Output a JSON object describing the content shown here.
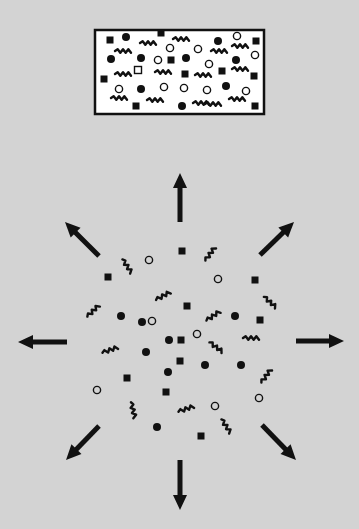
{
  "figure": {
    "title": "Diffusion of confined particles",
    "background_color": "#d3d3d3",
    "ink_color": "#111111",
    "box_fill": "#ffffff"
  },
  "container": {
    "x": 95,
    "y": 30,
    "w": 169,
    "h": 84,
    "particles": [
      {
        "type": "square",
        "x": 110,
        "y": 40
      },
      {
        "type": "dot",
        "x": 126,
        "y": 37
      },
      {
        "type": "square",
        "x": 161,
        "y": 33
      },
      {
        "type": "squiggle",
        "x": 148,
        "y": 43,
        "angle": 0
      },
      {
        "type": "squiggle",
        "x": 181,
        "y": 39,
        "angle": 0
      },
      {
        "type": "circle",
        "x": 170,
        "y": 48
      },
      {
        "type": "dot",
        "x": 218,
        "y": 41
      },
      {
        "type": "circle",
        "x": 237,
        "y": 36
      },
      {
        "type": "squiggle",
        "x": 240,
        "y": 46,
        "angle": 0
      },
      {
        "type": "square",
        "x": 256,
        "y": 41
      },
      {
        "type": "squiggle",
        "x": 123,
        "y": 51,
        "angle": 0
      },
      {
        "type": "circle",
        "x": 198,
        "y": 49
      },
      {
        "type": "squiggle",
        "x": 219,
        "y": 51,
        "angle": 0
      },
      {
        "type": "circle",
        "x": 255,
        "y": 55
      },
      {
        "type": "dot",
        "x": 111,
        "y": 59
      },
      {
        "type": "dot",
        "x": 141,
        "y": 58
      },
      {
        "type": "circle",
        "x": 158,
        "y": 60
      },
      {
        "type": "square",
        "x": 171,
        "y": 60
      },
      {
        "type": "dot",
        "x": 186,
        "y": 58
      },
      {
        "type": "circle",
        "x": 209,
        "y": 64
      },
      {
        "type": "dot",
        "x": 236,
        "y": 60
      },
      {
        "type": "squiggle",
        "x": 123,
        "y": 74,
        "angle": 0
      },
      {
        "type": "opensquare",
        "x": 138,
        "y": 70
      },
      {
        "type": "squiggle",
        "x": 163,
        "y": 72,
        "angle": 0
      },
      {
        "type": "square",
        "x": 185,
        "y": 74
      },
      {
        "type": "squiggle",
        "x": 203,
        "y": 75,
        "angle": 0
      },
      {
        "type": "square",
        "x": 222,
        "y": 71
      },
      {
        "type": "squiggle",
        "x": 240,
        "y": 69,
        "angle": 0
      },
      {
        "type": "square",
        "x": 104,
        "y": 79
      },
      {
        "type": "square",
        "x": 254,
        "y": 76
      },
      {
        "type": "circle",
        "x": 119,
        "y": 89
      },
      {
        "type": "dot",
        "x": 141,
        "y": 89
      },
      {
        "type": "circle",
        "x": 164,
        "y": 87
      },
      {
        "type": "circle",
        "x": 184,
        "y": 88
      },
      {
        "type": "circle",
        "x": 207,
        "y": 90
      },
      {
        "type": "dot",
        "x": 226,
        "y": 86
      },
      {
        "type": "circle",
        "x": 246,
        "y": 91
      },
      {
        "type": "squiggle",
        "x": 119,
        "y": 98,
        "angle": 0
      },
      {
        "type": "squiggle",
        "x": 155,
        "y": 100,
        "angle": 0
      },
      {
        "type": "squiggle",
        "x": 201,
        "y": 103,
        "angle": 0
      },
      {
        "type": "squiggle",
        "x": 237,
        "y": 99,
        "angle": 0
      },
      {
        "type": "square",
        "x": 136,
        "y": 106
      },
      {
        "type": "dot",
        "x": 182,
        "y": 106
      },
      {
        "type": "squiggle",
        "x": 213,
        "y": 104,
        "angle": 0
      },
      {
        "type": "square",
        "x": 255,
        "y": 106
      }
    ]
  },
  "arrows": [
    {
      "direction": "up",
      "x1": 180,
      "y1": 222,
      "x2": 180,
      "y2": 173
    },
    {
      "direction": "up-right",
      "x1": 260,
      "y1": 255,
      "x2": 294,
      "y2": 222
    },
    {
      "direction": "right",
      "x1": 296,
      "y1": 341,
      "x2": 344,
      "y2": 341
    },
    {
      "direction": "down-right",
      "x1": 262,
      "y1": 425,
      "x2": 296,
      "y2": 460
    },
    {
      "direction": "down",
      "x1": 180,
      "y1": 460,
      "x2": 180,
      "y2": 510
    },
    {
      "direction": "down-left",
      "x1": 99,
      "y1": 426,
      "x2": 66,
      "y2": 460
    },
    {
      "direction": "left",
      "x1": 67,
      "y1": 342,
      "x2": 18,
      "y2": 342
    },
    {
      "direction": "up-left",
      "x1": 99,
      "y1": 256,
      "x2": 65,
      "y2": 222
    }
  ],
  "dispersed": {
    "particles": [
      {
        "type": "square",
        "x": 182,
        "y": 251
      },
      {
        "type": "squiggle",
        "x": 127,
        "y": 266,
        "angle": 55
      },
      {
        "type": "circle",
        "x": 149,
        "y": 260
      },
      {
        "type": "squiggle",
        "x": 210,
        "y": 254,
        "angle": -55
      },
      {
        "type": "square",
        "x": 108,
        "y": 277
      },
      {
        "type": "circle",
        "x": 218,
        "y": 279
      },
      {
        "type": "square",
        "x": 255,
        "y": 280
      },
      {
        "type": "squiggle",
        "x": 163,
        "y": 296,
        "angle": -30
      },
      {
        "type": "squiggle",
        "x": 93,
        "y": 311,
        "angle": -45
      },
      {
        "type": "square",
        "x": 187,
        "y": 306
      },
      {
        "type": "squiggle",
        "x": 270,
        "y": 302,
        "angle": 40
      },
      {
        "type": "dot",
        "x": 121,
        "y": 316
      },
      {
        "type": "circle",
        "x": 152,
        "y": 321
      },
      {
        "type": "squiggle",
        "x": 213,
        "y": 316,
        "angle": -35
      },
      {
        "type": "dot",
        "x": 235,
        "y": 316
      },
      {
        "type": "square",
        "x": 260,
        "y": 320
      },
      {
        "type": "dot",
        "x": 169,
        "y": 340
      },
      {
        "type": "circle",
        "x": 197,
        "y": 334
      },
      {
        "type": "squiggle",
        "x": 251,
        "y": 338,
        "angle": 0
      },
      {
        "type": "squiggle",
        "x": 110,
        "y": 350,
        "angle": -20
      },
      {
        "type": "squiggle",
        "x": 216,
        "y": 347,
        "angle": 35
      },
      {
        "type": "dot",
        "x": 146,
        "y": 352
      },
      {
        "type": "dot",
        "x": 205,
        "y": 365
      },
      {
        "type": "square",
        "x": 180,
        "y": 361
      },
      {
        "type": "square",
        "x": 127,
        "y": 378
      },
      {
        "type": "dot",
        "x": 241,
        "y": 365
      },
      {
        "type": "dot",
        "x": 168,
        "y": 372
      },
      {
        "type": "squiggle",
        "x": 266,
        "y": 376,
        "angle": -55
      },
      {
        "type": "circle",
        "x": 97,
        "y": 390
      },
      {
        "type": "square",
        "x": 166,
        "y": 392
      },
      {
        "type": "square",
        "x": 181,
        "y": 340
      },
      {
        "type": "circle",
        "x": 259,
        "y": 398
      },
      {
        "type": "squiggle",
        "x": 133,
        "y": 410,
        "angle": 75
      },
      {
        "type": "squiggle",
        "x": 186,
        "y": 409,
        "angle": -20
      },
      {
        "type": "circle",
        "x": 215,
        "y": 406
      },
      {
        "type": "squiggle",
        "x": 226,
        "y": 426,
        "angle": 55
      },
      {
        "type": "dot",
        "x": 157,
        "y": 427
      },
      {
        "type": "square",
        "x": 201,
        "y": 436
      },
      {
        "type": "dot",
        "x": 142,
        "y": 322
      }
    ]
  }
}
